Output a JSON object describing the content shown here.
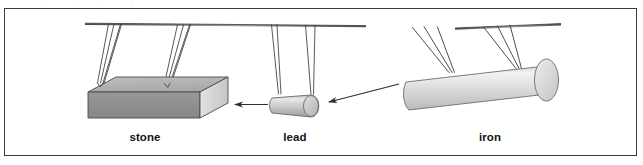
{
  "figure": {
    "kind": "physics-illustration",
    "background_color": "#ffffff",
    "frame": {
      "border_color": "#3b3b3b",
      "border_width_px": 1.4,
      "fill": "#ffffff"
    },
    "clipped_header_sliver": "' ' ' '",
    "objects": [
      {
        "id": "stone",
        "label": "stone",
        "shape": "rectangular-block",
        "top_face_color": "#b4b4b4",
        "front_face_color": "#8e8e8e",
        "side_face_color": "#d8d8d8",
        "outline_color": "#4a4a4a",
        "string_groups": 2,
        "strings_per_group": 3
      },
      {
        "id": "lead",
        "label": "lead",
        "shape": "cylinder-horizontal",
        "body_color_light": "#e6e6e6",
        "body_color_dark": "#a8a8a8",
        "cap_color": "#cfcfcf",
        "outline_color": "#6a6a6a",
        "string_groups": 2,
        "strings_per_group": 2
      },
      {
        "id": "iron",
        "label": "iron",
        "shape": "cylinder-horizontal-large",
        "body_color_light": "#efefef",
        "body_color_dark": "#c2c2c2",
        "cap_color": "#dedede",
        "outline_color": "#7a7a7a",
        "string_groups": 2,
        "strings_per_group": 2
      }
    ],
    "support_bars": [
      {
        "id": "bar-left",
        "note": "horizontal support bar above stone and lead"
      },
      {
        "id": "bar-right",
        "note": "horizontal support bar above iron"
      }
    ],
    "arrows": [
      {
        "id": "arrow-lead-to-stone",
        "from": "lead",
        "to": "stone",
        "direction": "left",
        "color": "#2e2e2e"
      },
      {
        "id": "arrow-iron-to-lead",
        "from": "iron",
        "to": "lead",
        "direction": "down-left",
        "color": "#2e2e2e"
      }
    ],
    "captions": {
      "stone": "stone",
      "lead": "lead",
      "iron": "iron"
    },
    "colors": {
      "ink": "#141414",
      "line": "#3b3b3b",
      "arrow": "#2e2e2e",
      "string": "#3a3a3a"
    }
  }
}
